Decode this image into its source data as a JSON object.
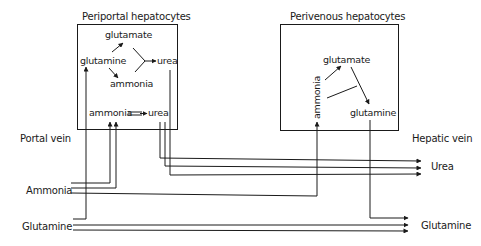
{
  "diagram": {
    "periportal": {
      "title": "Periportal hepatocytes",
      "nodes": {
        "glutamate": "glutamate",
        "glutamine": "glutamine",
        "ammonia_top": "ammonia",
        "urea_top": "urea",
        "ammonia_bottom": "ammonia",
        "urea_bottom": "urea"
      }
    },
    "perivenous": {
      "title": "Perivenous hepatocytes",
      "nodes": {
        "glutamate": "glutamate",
        "ammonia": "ammonia",
        "glutamine": "glutamine"
      }
    },
    "left_labels": {
      "portal_vein": "Portal vein",
      "ammonia": "Ammonia",
      "glutamine": "Glutamine"
    },
    "right_labels": {
      "hepatic_vein": "Hepatic vein",
      "urea": "Urea",
      "glutamine": "Glutamine"
    },
    "colors": {
      "line": "#1a1a1a",
      "background": "#ffffff"
    }
  }
}
